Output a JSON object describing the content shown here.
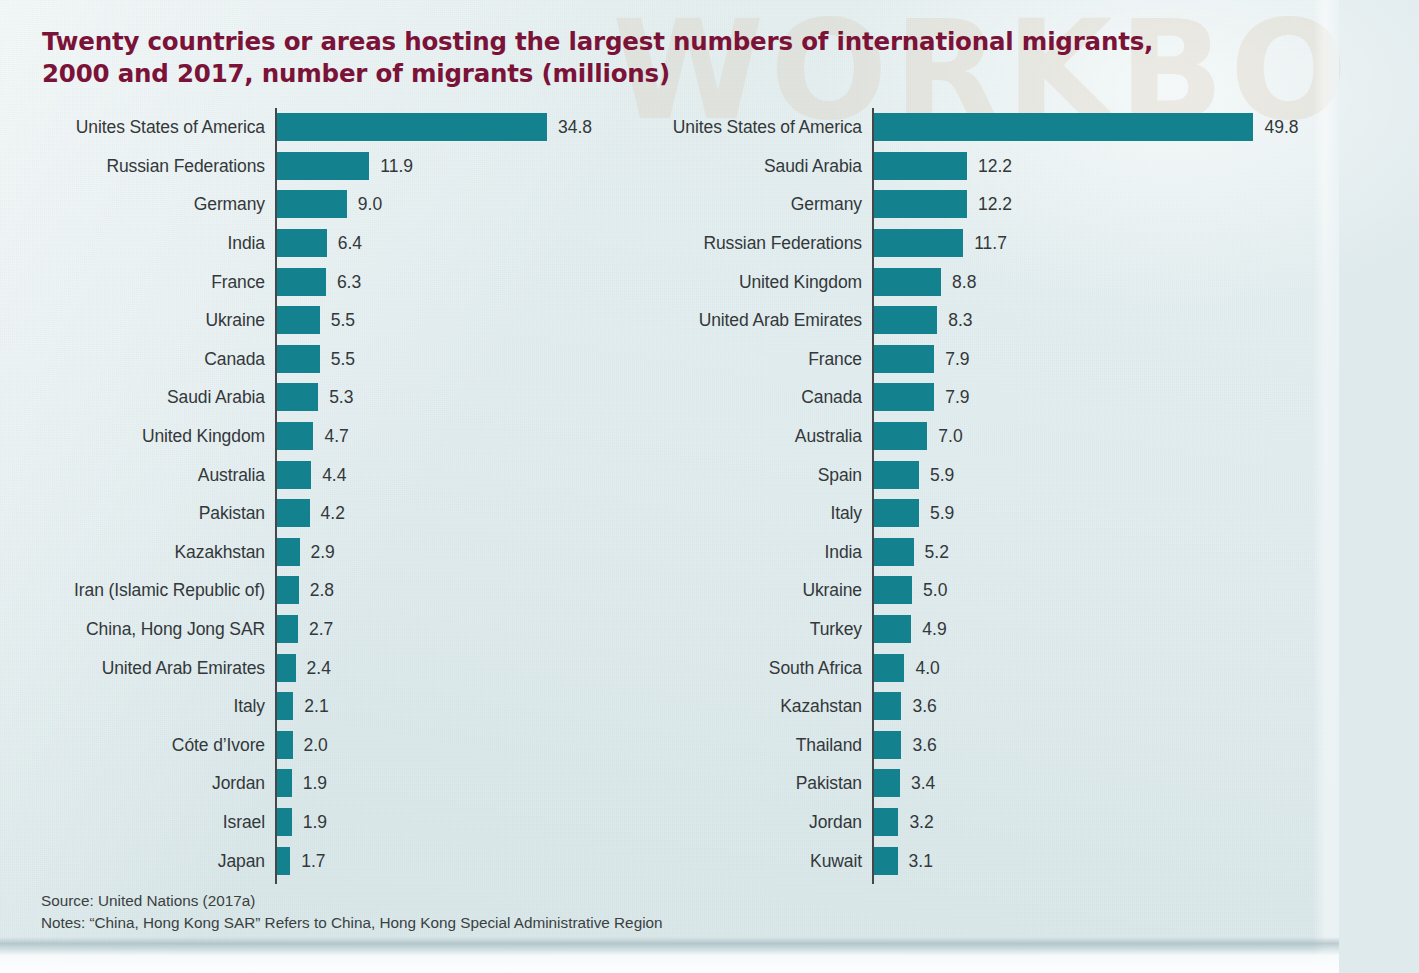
{
  "title": "Twenty countries or areas hosting the largest numbers of international migrants,\n2000 and 2017, number of migrants (millions)",
  "colors": {
    "bar": "#14818e",
    "title": "#7b1338",
    "axis": "#44484a",
    "label": "#33383a",
    "background": "#e2edef"
  },
  "watermark_text": "WORKBO",
  "footer": {
    "source": "Source: United Nations (2017a)",
    "notes": "Notes: “China, Hong Kong SAR” Refers to China, Hong Kong Special Administrative Region"
  },
  "chart_data": [
    {
      "type": "bar",
      "orientation": "horizontal",
      "panel": "left",
      "year": "2000",
      "title": "Twenty countries or areas hosting the largest numbers of international migrants, 2000",
      "xlabel": "",
      "ylabel": "",
      "unit": "millions",
      "xlim": [
        0,
        34.8
      ],
      "grid": false,
      "legend": "none",
      "categories": [
        "Unites States of America",
        "Russian Federations",
        "Germany",
        "India",
        "France",
        "Ukraine",
        "Canada",
        "Saudi Arabia",
        "United Kingdom",
        "Australia",
        "Pakistan",
        "Kazakhstan",
        "Iran (Islamic Republic of)",
        "China, Hong Jong SAR",
        "United Arab Emirates",
        "Italy",
        "Cóte d’Ivore",
        "Jordan",
        "Israel",
        "Japan"
      ],
      "values": [
        34.8,
        11.9,
        9.0,
        6.4,
        6.3,
        5.5,
        5.5,
        5.3,
        4.7,
        4.4,
        4.2,
        2.9,
        2.8,
        2.7,
        2.4,
        2.1,
        2.0,
        1.9,
        1.9,
        1.7
      ],
      "value_labels": [
        "34.8",
        "11.9",
        "9.0",
        "6.4",
        "6.3",
        "5.5",
        "5.5",
        "5.3",
        "4.7",
        "4.4",
        "4.2",
        "2.9",
        "2.8",
        "2.7",
        "2.4",
        "2.1",
        "2.0",
        "1.9",
        "1.9",
        "1.7"
      ]
    },
    {
      "type": "bar",
      "orientation": "horizontal",
      "panel": "right",
      "year": "2017",
      "title": "Twenty countries or areas hosting the largest numbers of international migrants, 2017",
      "xlabel": "",
      "ylabel": "",
      "unit": "millions",
      "xlim": [
        0,
        49.8
      ],
      "grid": false,
      "legend": "none",
      "categories": [
        "Unites States of America",
        "Saudi Arabia",
        "Germany",
        "Russian Federations",
        "United Kingdom",
        "United Arab Emirates",
        "France",
        "Canada",
        "Australia",
        "Spain",
        "Italy",
        "India",
        "Ukraine",
        "Turkey",
        "South Africa",
        "Kazahstan",
        "Thailand",
        "Pakistan",
        "Jordan",
        "Kuwait"
      ],
      "values": [
        49.8,
        12.2,
        12.2,
        11.7,
        8.8,
        8.3,
        7.9,
        7.9,
        7.0,
        5.9,
        5.9,
        5.2,
        5.0,
        4.9,
        4.0,
        3.6,
        3.6,
        3.4,
        3.2,
        3.1
      ],
      "value_labels": [
        "49.8",
        "12.2",
        "12.2",
        "11.7",
        "8.8",
        "8.3",
        "7.9",
        "7.9",
        "7.0",
        "5.9",
        "5.9",
        "5.2",
        "5.0",
        "4.9",
        "4.0",
        "3.6",
        "3.6",
        "3.4",
        "3.2",
        "3.1"
      ]
    }
  ]
}
